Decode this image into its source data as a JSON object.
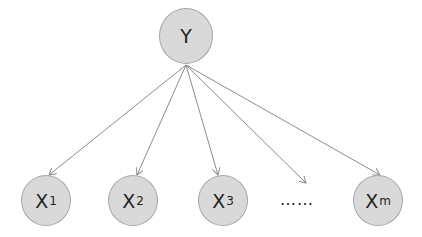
{
  "diagram": {
    "type": "naive-bayes-graphical-model",
    "colors": {
      "node_fill": "#d9d9d9",
      "node_border": "#a6a6a6",
      "edge": "#8c8c8c",
      "text": "#222222"
    },
    "root": {
      "label": "Y",
      "cx": 186,
      "cy": 35,
      "r": 27
    },
    "children": [
      {
        "label": "X",
        "sub": "1",
        "cx": 46,
        "cy": 200,
        "r": 24
      },
      {
        "label": "X",
        "sub": "2",
        "cx": 133,
        "cy": 200,
        "r": 24
      },
      {
        "label": "X",
        "sub": "3",
        "cx": 223,
        "cy": 200,
        "r": 24
      },
      {
        "label": "X",
        "sub": "m",
        "cx": 378,
        "cy": 200,
        "r": 24
      }
    ],
    "ellipsis": {
      "label": "…… ",
      "x": 285,
      "y": 188,
      "arrow_end": {
        "x": 306,
        "y": 183
      }
    },
    "edge_origin": {
      "x": 186,
      "y": 65
    }
  }
}
